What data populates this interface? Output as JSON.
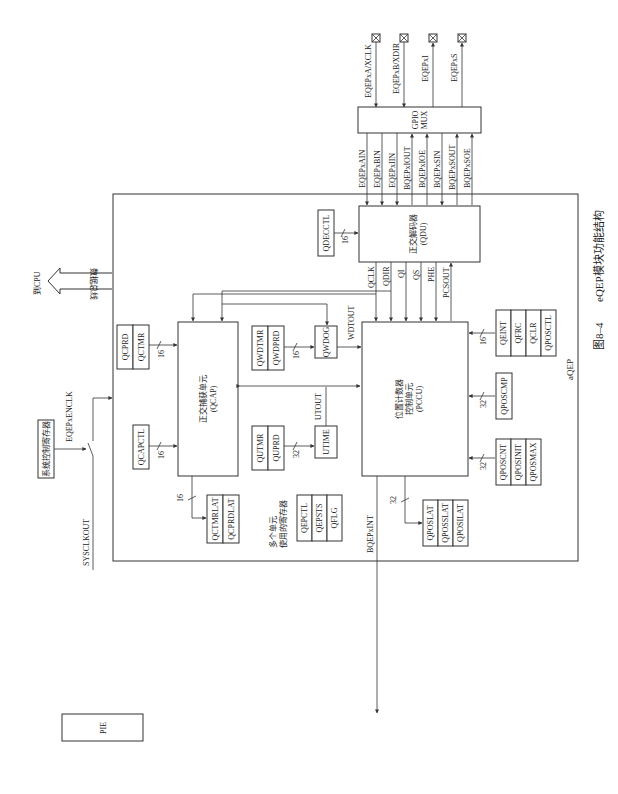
{
  "figure": {
    "caption_number": "图8–4",
    "caption_text": "eQEP模块功能结构",
    "module_label": "aQEP"
  },
  "pins": [
    "EQEPxA/XCLK",
    "EQEPxB/XDIR",
    "EQEPxI",
    "EQEPxS"
  ],
  "gpio_mux": {
    "line1": "GPIO",
    "line2": "MUX"
  },
  "mux_signals": [
    "EQEPxAIN",
    "EQEPxBIN",
    "EQEPxIIN",
    "BQEPxIOUT",
    "BQEPxIOE",
    "BQEPxSIN",
    "BQEPxSOUT",
    "BQEPxSOE"
  ],
  "qdu": {
    "name": "正交解码器",
    "abbr": "(QDU)",
    "reg": "QDECCTL",
    "bus": "16"
  },
  "qdu_outputs": [
    "QCLK",
    "QDIR",
    "QI",
    "QS",
    "PHE",
    "PCSOUT"
  ],
  "qcap": {
    "name": "正交捕获单元",
    "abbr": "(QCAP)"
  },
  "pccu": {
    "name1": "位置计数器",
    "name2": "控制单元",
    "abbr": "(PCCU)"
  },
  "qwdog": {
    "name": "QWDOG",
    "out": "WDTOUT",
    "regs": [
      "QWDTMR",
      "QWDPRD"
    ],
    "bus": "16"
  },
  "utime": {
    "name": "UTIME",
    "out": "UTOUT",
    "regs": [
      "QUTMR",
      "QUPRD"
    ],
    "bus": "32"
  },
  "qcap_regs_top": {
    "regs": [
      "QCPRD",
      "QCTMR"
    ],
    "bus": "16"
  },
  "qcap_regs_ctl": {
    "regs": [
      "QCAPCTL"
    ],
    "bus": "16"
  },
  "qcap_latch": {
    "regs": [
      "QCTMRLAT",
      "QCPRDLAT"
    ],
    "bus": "16"
  },
  "shared_regs": {
    "label1": "多个单元",
    "label2": "使用的寄存器",
    "regs": [
      "QEPCTL",
      "QEPSTS",
      "QFLG"
    ]
  },
  "pos_latch": {
    "regs": [
      "QPOSLAT",
      "QPOSSLAT",
      "QPOSILAT"
    ],
    "bus": "32"
  },
  "int_regs": {
    "regs": [
      "QEINT",
      "QFRC",
      "QCLR",
      "QPOSCTL"
    ],
    "bus": "16"
  },
  "cmp_regs": {
    "regs": [
      "QPOSCMP"
    ],
    "bus": "32"
  },
  "cnt_regs": {
    "regs": [
      "QPOSCNT",
      "QPOSINIT",
      "QPOSMAX"
    ],
    "bus": "32"
  },
  "cpu": {
    "label": "到CPU",
    "bus_label": "数据总线"
  },
  "clock": {
    "reg": "系统控制寄存器",
    "enable": "EQEPxENCLK",
    "sysclk": "SYSCLKOUT"
  },
  "interrupt": {
    "signal": "BQEPxINT",
    "target": "PIE"
  }
}
